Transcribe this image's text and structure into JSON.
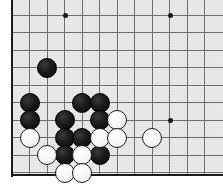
{
  "app": {
    "title": "Go Board Diagram",
    "description": "Cropped go board showing lower-left corner position"
  },
  "board": {
    "background_color": "#e9e9e7",
    "line_color": "#6e6e6e",
    "edge_color": "#1a1a1a",
    "black_stone_color": "#141414",
    "white_stone_color": "#fbfbfb",
    "origin_x": 12,
    "origin_y": 15,
    "cell_size": 17.5,
    "stone_diameter": 20,
    "columns": 12,
    "rows": 10,
    "left_edge_x": 12,
    "bottom_edge_y": 175,
    "top_row_y": 15
  },
  "grid": {
    "vertical_x": [
      12,
      29.5,
      47,
      64.5,
      82,
      99.5,
      117,
      134.5,
      152,
      169.5,
      187,
      204.5
    ],
    "horizontal_y": [
      15,
      32.5,
      50,
      67.5,
      85,
      102.5,
      120,
      137.5,
      155,
      172.5
    ]
  },
  "star_points": [
    {
      "name": "hoshi-top-left",
      "x": 64.5,
      "y": 15
    },
    {
      "name": "hoshi-top-right",
      "x": 169.5,
      "y": 15
    },
    {
      "name": "hoshi-right",
      "x": 169.5,
      "y": 120
    }
  ],
  "stones": [
    {
      "id": "b1",
      "color": "black",
      "x": 47,
      "y": 67.5
    },
    {
      "id": "b2",
      "color": "black",
      "x": 29.5,
      "y": 102.5
    },
    {
      "id": "b3",
      "color": "black",
      "x": 29.5,
      "y": 120
    },
    {
      "id": "b4",
      "color": "black",
      "x": 82,
      "y": 102.5
    },
    {
      "id": "b5",
      "color": "black",
      "x": 99.5,
      "y": 102.5
    },
    {
      "id": "b6",
      "color": "black",
      "x": 64.5,
      "y": 120
    },
    {
      "id": "b7",
      "color": "black",
      "x": 99.5,
      "y": 120
    },
    {
      "id": "b8",
      "color": "black",
      "x": 64.5,
      "y": 137.5
    },
    {
      "id": "b9",
      "color": "black",
      "x": 82,
      "y": 137.5
    },
    {
      "id": "b10",
      "color": "black",
      "x": 64.5,
      "y": 155
    },
    {
      "id": "b11",
      "color": "black",
      "x": 99.5,
      "y": 155
    },
    {
      "id": "w1",
      "color": "white",
      "x": 29.5,
      "y": 137.5
    },
    {
      "id": "w2",
      "color": "white",
      "x": 117,
      "y": 120
    },
    {
      "id": "w3",
      "color": "white",
      "x": 99.5,
      "y": 137.5
    },
    {
      "id": "w4",
      "color": "white",
      "x": 117,
      "y": 137.5
    },
    {
      "id": "w5",
      "color": "white",
      "x": 47,
      "y": 155
    },
    {
      "id": "w6",
      "color": "white",
      "x": 82,
      "y": 155
    },
    {
      "id": "w7",
      "color": "white",
      "x": 152,
      "y": 137.5
    },
    {
      "id": "w8",
      "color": "white",
      "x": 64.5,
      "y": 172.5
    },
    {
      "id": "w9",
      "color": "white",
      "x": 82,
      "y": 172.5
    }
  ]
}
